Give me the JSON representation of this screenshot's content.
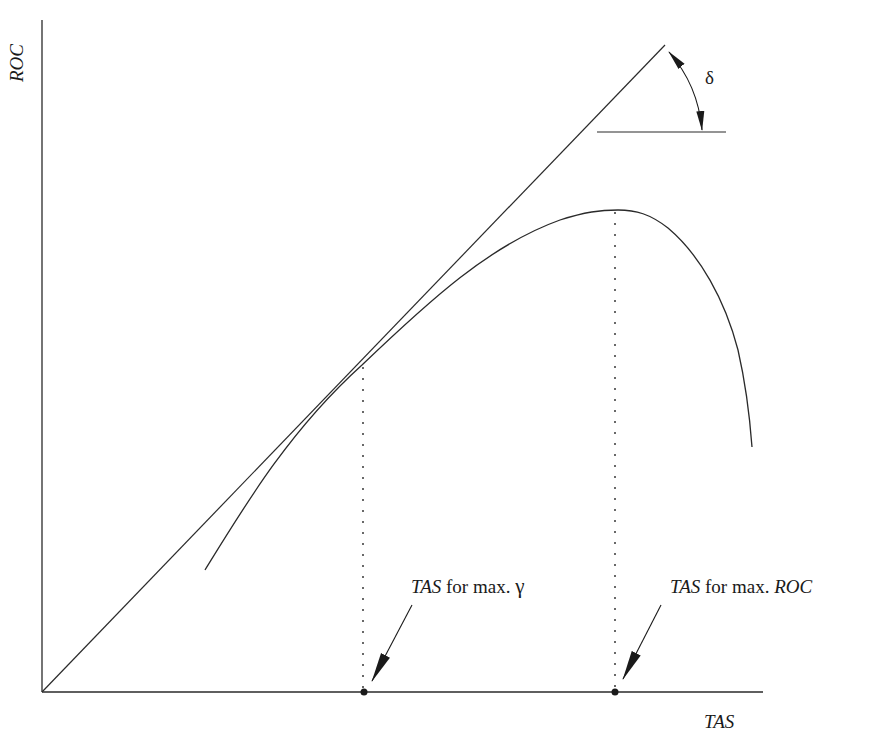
{
  "diagram": {
    "axes": {
      "y_label": "ROC",
      "x_label": "TAS"
    },
    "angle_label": "δ",
    "annotations": [
      {
        "id": "max-gamma",
        "italic_part": "TAS",
        "text_part": " for max. ",
        "symbol": "γ",
        "symbol_italic": false
      },
      {
        "id": "max-roc",
        "italic_part": "TAS",
        "text_part": " for max. ",
        "symbol": "ROC",
        "symbol_italic": true
      }
    ],
    "colors": {
      "line": "#2a2a2a",
      "background": "#ffffff"
    }
  }
}
